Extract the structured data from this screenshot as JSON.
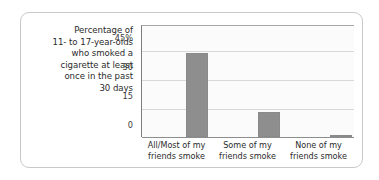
{
  "chart_data": {
    "type": "bar",
    "title": "",
    "caption_lines": [
      "Percentage of",
      "11- to 17-year-olds",
      "who smoked a",
      "cigarette at least",
      "once in the past",
      "30 days"
    ],
    "categories": [
      [
        "All/Most of my",
        "friends smoke"
      ],
      [
        "Some of my",
        "friends smoke"
      ],
      [
        "None of my",
        "friends smoke"
      ]
    ],
    "category_labels": [
      "All/Most of my friends smoke",
      "Some of my friends smoke",
      "None of my friends smoke"
    ],
    "values": [
      44,
      13,
      1
    ],
    "xlabel": "",
    "ylabel": "",
    "ylim": [
      0,
      52
    ],
    "yticks": [
      45,
      30,
      15,
      0
    ],
    "ytick_labels": [
      "45%",
      "30",
      "15",
      "0"
    ],
    "grid": true,
    "legend": "none",
    "bar_color": "#8e8e8e",
    "gridline_color": "#d8d8d8",
    "axis_color": "#8d8d8d",
    "plot_background": "#fbfbfb",
    "card_border_color": "#c9c9c9"
  }
}
